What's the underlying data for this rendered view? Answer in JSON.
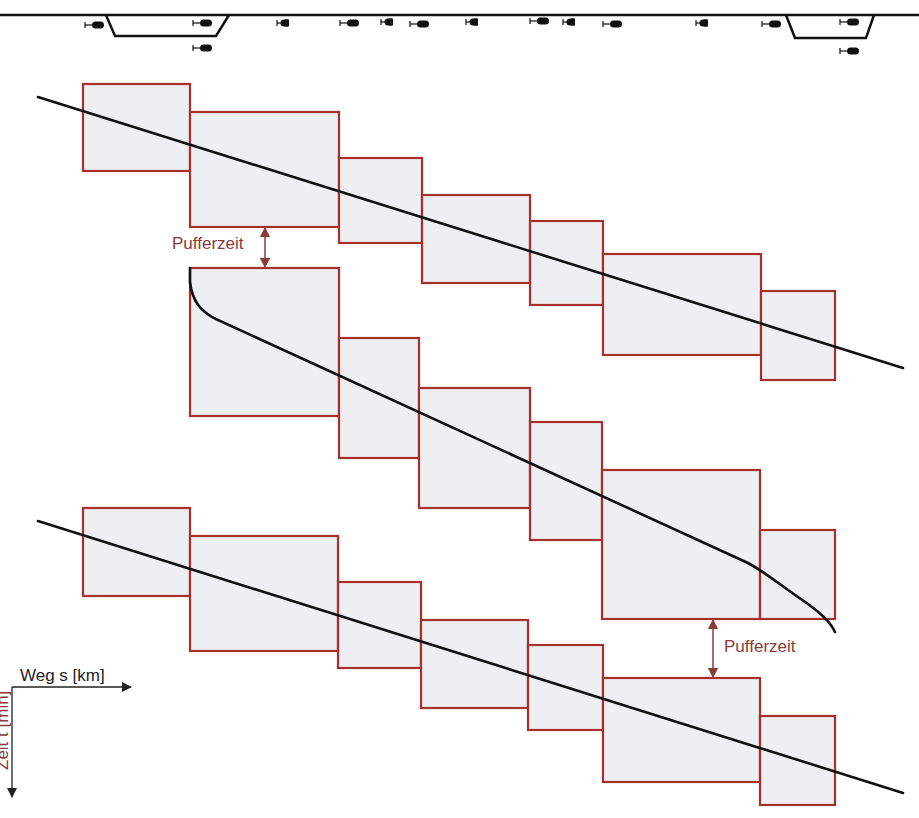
{
  "colors": {
    "block_stroke": "#a8302c",
    "block_fill": "#eeeff2",
    "path_line": "#111111",
    "annotation": "#8b3a3a",
    "axis": "#222222",
    "track": "#111111"
  },
  "track": {
    "main_line": {
      "x1": 0,
      "x2": 919,
      "y": 15
    },
    "sidings": [
      {
        "points": "106,15 115,36 216,36 229,15"
      },
      {
        "points": "786,15 795,38 866,38 874,15"
      }
    ],
    "signals": [
      {
        "x": 85,
        "y": 25,
        "type": "round"
      },
      {
        "x": 193,
        "y": 23,
        "type": "round"
      },
      {
        "x": 193,
        "y": 48,
        "type": "round"
      },
      {
        "x": 277,
        "y": 23,
        "type": "half"
      },
      {
        "x": 340,
        "y": 23,
        "type": "round"
      },
      {
        "x": 381,
        "y": 22,
        "type": "half"
      },
      {
        "x": 410,
        "y": 24,
        "type": "round"
      },
      {
        "x": 466,
        "y": 22,
        "type": "half"
      },
      {
        "x": 530,
        "y": 21,
        "type": "round"
      },
      {
        "x": 563,
        "y": 22,
        "type": "half"
      },
      {
        "x": 603,
        "y": 24,
        "type": "round"
      },
      {
        "x": 696,
        "y": 23,
        "type": "half"
      },
      {
        "x": 762,
        "y": 24,
        "type": "round"
      },
      {
        "x": 840,
        "y": 22,
        "type": "round"
      },
      {
        "x": 840,
        "y": 51,
        "type": "round"
      }
    ]
  },
  "trains": [
    {
      "name": "train-1",
      "blocks": [
        {
          "x": 83,
          "y": 84,
          "w": 107,
          "h": 87
        },
        {
          "x": 190,
          "y": 112,
          "w": 149,
          "h": 115
        },
        {
          "x": 339,
          "y": 158,
          "w": 83,
          "h": 85
        },
        {
          "x": 422,
          "y": 195,
          "w": 108,
          "h": 88
        },
        {
          "x": 530,
          "y": 221,
          "w": 73,
          "h": 84
        },
        {
          "x": 603,
          "y": 254,
          "w": 158,
          "h": 101
        },
        {
          "x": 761,
          "y": 291,
          "w": 74,
          "h": 89
        }
      ],
      "path": "M38,97 L903,368"
    },
    {
      "name": "train-2",
      "blocks": [
        {
          "x": 190,
          "y": 268,
          "w": 149,
          "h": 148
        },
        {
          "x": 339,
          "y": 338,
          "w": 80,
          "h": 120
        },
        {
          "x": 419,
          "y": 388,
          "w": 111,
          "h": 120
        },
        {
          "x": 530,
          "y": 422,
          "w": 72,
          "h": 118
        },
        {
          "x": 602,
          "y": 470,
          "w": 158,
          "h": 149
        },
        {
          "x": 760,
          "y": 530,
          "w": 75,
          "h": 89
        }
      ],
      "path": "M190,268 L190,282 C192,300 200,312 218,320 L748,563 C765,572 780,585 808,604 C826,617 832,625 835,632"
    },
    {
      "name": "train-3",
      "blocks": [
        {
          "x": 83,
          "y": 508,
          "w": 107,
          "h": 88
        },
        {
          "x": 190,
          "y": 536,
          "w": 148,
          "h": 115
        },
        {
          "x": 338,
          "y": 582,
          "w": 83,
          "h": 86
        },
        {
          "x": 421,
          "y": 620,
          "w": 107,
          "h": 88
        },
        {
          "x": 528,
          "y": 645,
          "w": 75,
          "h": 85
        },
        {
          "x": 603,
          "y": 678,
          "w": 157,
          "h": 104
        },
        {
          "x": 760,
          "y": 716,
          "w": 75,
          "h": 89
        }
      ],
      "path": "M38,521 L903,793"
    }
  ],
  "annotations": {
    "buffer_top": {
      "label": "Pufferzeit",
      "text_x": 172,
      "text_y": 249,
      "arrow_x": 265,
      "y1": 229,
      "y2": 266
    },
    "buffer_bottom": {
      "label": "Pufferzeit",
      "text_x": 724,
      "text_y": 652,
      "arrow_x": 713,
      "y1": 621,
      "y2": 676
    }
  },
  "axes": {
    "x_label": "Weg s [km]",
    "y_label": "Zeit t [min]",
    "origin": {
      "x": 12,
      "y": 687
    },
    "x_end": 131,
    "y_end": 797
  }
}
